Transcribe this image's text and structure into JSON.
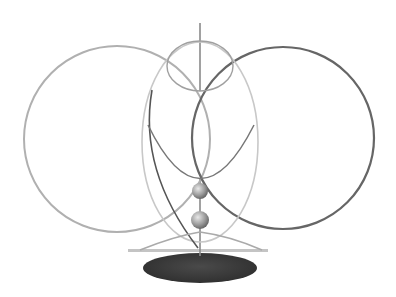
{
  "diagram": {
    "title": "",
    "background": "#ffffff",
    "colors": {
      "left_ring": "#a8a8a8",
      "right_ring": "#5a5a5a",
      "egg_outline": "#bdbdbd",
      "inner_ellipse": "#9a9a9a",
      "bowl_arc": "#7d7d7d",
      "rod": "#8a8a8a",
      "sphere_light": "#e0e0e0",
      "sphere_dark": "#6e6e6e",
      "base": "#3a3a3a",
      "base_bar": "#b0b0b0"
    },
    "shapes": {
      "left_ring": {
        "cx": 117,
        "cy": 139,
        "r": 93
      },
      "right_ring": {
        "cx": 283,
        "cy": 138,
        "r": 91
      },
      "egg": {
        "cx": 200,
        "cy": 140,
        "rx": 58,
        "ry": 100
      },
      "top_ellipse": {
        "cx": 200,
        "cy": 66,
        "rx": 33,
        "ry": 25
      },
      "spheres": [
        {
          "cx": 200,
          "cy": 191,
          "r": 8
        },
        {
          "cx": 200,
          "cy": 220,
          "r": 9
        }
      ],
      "base": {
        "cx": 200,
        "cy": 268,
        "rx": 57,
        "ry": 15
      }
    }
  }
}
